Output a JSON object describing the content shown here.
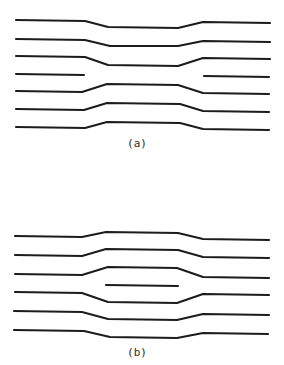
{
  "figure": {
    "panels": [
      {
        "id": "a",
        "label": "(a)",
        "label_pos": [
          137,
          147
        ],
        "lines": [
          {
            "kind": "dip",
            "points": [
              [
                16,
                20
              ],
              [
                85,
                21
              ],
              [
                108,
                27
              ],
              [
                178,
                28
              ],
              [
                203,
                22
              ],
              [
                270,
                23
              ]
            ]
          },
          {
            "kind": "dip",
            "points": [
              [
                16,
                39
              ],
              [
                85,
                40
              ],
              [
                110,
                46
              ],
              [
                178,
                46
              ],
              [
                203,
                41
              ],
              [
                270,
                42
              ]
            ]
          },
          {
            "kind": "dip",
            "points": [
              [
                16,
                56
              ],
              [
                85,
                57
              ],
              [
                108,
                65
              ],
              [
                178,
                66
              ],
              [
                203,
                58
              ],
              [
                270,
                59
              ]
            ]
          },
          {
            "kind": "broken-left",
            "points": [
              [
                16,
                74
              ],
              [
                84,
                75
              ]
            ]
          },
          {
            "kind": "broken-right",
            "points": [
              [
                204,
                76
              ],
              [
                269,
                77
              ]
            ]
          },
          {
            "kind": "bulge",
            "points": [
              [
                16,
                91
              ],
              [
                82,
                92
              ],
              [
                107,
                84
              ],
              [
                178,
                85
              ],
              [
                203,
                93
              ],
              [
                269,
                94
              ]
            ]
          },
          {
            "kind": "bulge",
            "points": [
              [
                16,
                109
              ],
              [
                84,
                110
              ],
              [
                107,
                103
              ],
              [
                180,
                104
              ],
              [
                203,
                111
              ],
              [
                269,
                112
              ]
            ]
          },
          {
            "kind": "bulge",
            "points": [
              [
                16,
                127
              ],
              [
                85,
                128
              ],
              [
                107,
                122
              ],
              [
                180,
                123
              ],
              [
                203,
                129
              ],
              [
                269,
                130
              ]
            ]
          }
        ]
      },
      {
        "id": "b",
        "label": "(b)",
        "label_pos": [
          137,
          356
        ],
        "lines": [
          {
            "kind": "bulge",
            "points": [
              [
                15,
                236
              ],
              [
                82,
                237
              ],
              [
                106,
                232
              ],
              [
                178,
                233
              ],
              [
                203,
                239
              ],
              [
                269,
                240
              ]
            ]
          },
          {
            "kind": "bulge",
            "points": [
              [
                15,
                255
              ],
              [
                82,
                256
              ],
              [
                106,
                249
              ],
              [
                178,
                250
              ],
              [
                203,
                257
              ],
              [
                269,
                258
              ]
            ]
          },
          {
            "kind": "bulge",
            "points": [
              [
                15,
                274
              ],
              [
                82,
                275
              ],
              [
                108,
                267
              ],
              [
                177,
                268
              ],
              [
                203,
                277
              ],
              [
                269,
                278
              ]
            ]
          },
          {
            "kind": "inserted",
            "points": [
              [
                106,
                285
              ],
              [
                178,
                286
              ]
            ]
          },
          {
            "kind": "dip",
            "points": [
              [
                15,
                292
              ],
              [
                82,
                293
              ],
              [
                108,
                302
              ],
              [
                177,
                303
              ],
              [
                203,
                294
              ],
              [
                269,
                295
              ]
            ]
          },
          {
            "kind": "dip",
            "points": [
              [
                14,
                311
              ],
              [
                82,
                312
              ],
              [
                108,
                319
              ],
              [
                177,
                320
              ],
              [
                203,
                314
              ],
              [
                269,
                315
              ]
            ]
          },
          {
            "kind": "dip",
            "points": [
              [
                14,
                330
              ],
              [
                84,
                331
              ],
              [
                110,
                337
              ],
              [
                177,
                338
              ],
              [
                203,
                333
              ],
              [
                268,
                334
              ]
            ]
          }
        ]
      }
    ]
  }
}
